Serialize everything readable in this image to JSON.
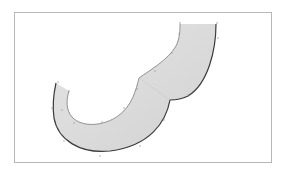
{
  "diagram": {
    "type": "curved-ribbon-shape",
    "frame": {
      "stroke": "#b8b8b8",
      "fill": "#ffffff"
    },
    "shape": {
      "fill": "#dcdcdc",
      "outer_edge_stroke": "#3a3a3a",
      "inner_edge_stroke": "#8a8a8a",
      "description": "Shaded ribbon sweeping from top-right down around a C-shaped arc to the left, with a scalloped cusp mid-way"
    },
    "markers": {
      "color": "#9a9a9a",
      "count": 16
    }
  }
}
